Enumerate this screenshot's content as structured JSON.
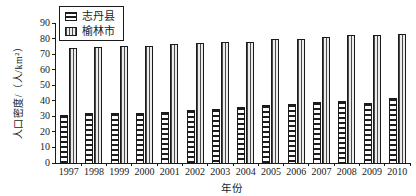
{
  "chart_data": {
    "type": "bar",
    "title": "",
    "xlabel": "年份",
    "ylabel": "人口密度/（人/km²）",
    "ylim": [
      0,
      90
    ],
    "ytick_step": 10,
    "yticks": [
      0,
      10,
      20,
      30,
      40,
      50,
      60,
      70,
      80,
      90
    ],
    "grid": false,
    "legend_position": "top-left",
    "categories": [
      "1997",
      "1998",
      "1999",
      "2000",
      "2001",
      "2002",
      "2003",
      "2004",
      "2005",
      "2006",
      "2007",
      "2008",
      "2009",
      "2010"
    ],
    "series": [
      {
        "id": "zhidan-county",
        "name": "志丹县",
        "pattern": "horizontal-stripes",
        "values": [
          31,
          32,
          32,
          32,
          33,
          34,
          35,
          36,
          37,
          38,
          39,
          40,
          38.5,
          42
        ]
      },
      {
        "id": "yulin-city",
        "name": "榆林市",
        "pattern": "vertical-stripes",
        "values": [
          74,
          74.5,
          75,
          75.5,
          76.5,
          77,
          78,
          78,
          79.5,
          80,
          81,
          82,
          82.5,
          83
        ]
      }
    ]
  },
  "colors": {
    "axis": "#1a1a1a",
    "bar_stroke": "#1a1a1a",
    "background": "#ffffff"
  }
}
